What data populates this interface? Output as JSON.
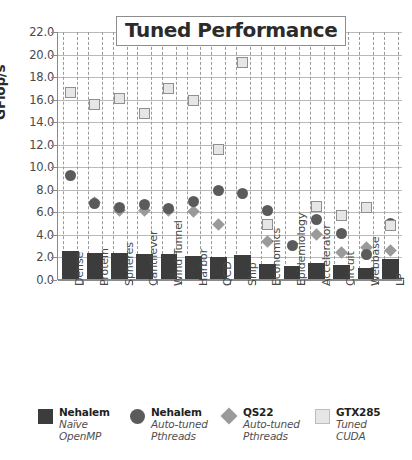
{
  "chart_data": {
    "type": "scatter",
    "title": "Tuned Performance",
    "xlabel": "",
    "ylabel": "GFlop/s",
    "ylim": [
      0,
      22
    ],
    "ytick_step": 2,
    "yticks": [
      "0.0",
      "2.0",
      "4.0",
      "6.0",
      "8.0",
      "10.0",
      "12.0",
      "14.0",
      "16.0",
      "18.0",
      "20.0",
      "22.0"
    ],
    "grid": true,
    "legend_position": "bottom",
    "categories": [
      "Dense",
      "Protein",
      "Spheres",
      "Cantilever",
      "Wind Tunnel",
      "Harbor",
      "QCD",
      "Ship",
      "Economics",
      "Epidemiology",
      "Accelerator",
      "Circuit",
      "Webbase",
      "LP"
    ],
    "series": [
      {
        "name": "Nehalem Naive OpenMP",
        "marker": "bar",
        "color": "#3c3c3c",
        "values": [
          2.45,
          2.35,
          2.28,
          2.2,
          2.18,
          2.08,
          1.95,
          2.1,
          1.3,
          1.15,
          1.45,
          1.2,
          1.0,
          1.8
        ]
      },
      {
        "name": "Nehalem Auto-tuned Pthreads",
        "marker": "circle",
        "color": "#5b5b5b",
        "values": [
          9.3,
          6.8,
          6.4,
          6.7,
          6.3,
          7.0,
          7.9,
          7.7,
          6.2,
          3.1,
          5.4,
          4.1,
          2.3,
          5.0
        ]
      },
      {
        "name": "QS22 Auto-tuned Pthreads",
        "marker": "diamond",
        "color": "#9a9a9a",
        "values": [
          null,
          6.9,
          6.2,
          6.2,
          6.2,
          6.1,
          4.9,
          null,
          3.4,
          null,
          4.0,
          2.4,
          2.9,
          2.6
        ]
      },
      {
        "name": "GTX285 Tuned CUDA",
        "marker": "square",
        "color": "#e6e6e6",
        "values": [
          16.6,
          15.6,
          16.1,
          14.8,
          17.0,
          15.9,
          11.6,
          19.3,
          4.9,
          null,
          6.5,
          5.7,
          6.4,
          4.8
        ]
      }
    ]
  },
  "legend": [
    {
      "title": "Nehalem",
      "sub1": "Naïve",
      "sub2": "OpenMP",
      "marker": "dark-square"
    },
    {
      "title": "Nehalem",
      "sub1": "Auto-tuned",
      "sub2": "Pthreads",
      "marker": "dark-circle"
    },
    {
      "title": "QS22",
      "sub1": "Auto-tuned",
      "sub2": "Pthreads",
      "marker": "gray-diamond"
    },
    {
      "title": "GTX285",
      "sub1": "Tuned",
      "sub2": "CUDA",
      "marker": "light-square"
    }
  ],
  "colors": {
    "bar": "#3c3c3c",
    "circle": "#5b5b5b",
    "diamond": "#9a9a9a",
    "square": "#e6e6e6",
    "grid": "#b9b9b9",
    "axis": "#8a8a8a",
    "text": "#4a4a4a"
  }
}
